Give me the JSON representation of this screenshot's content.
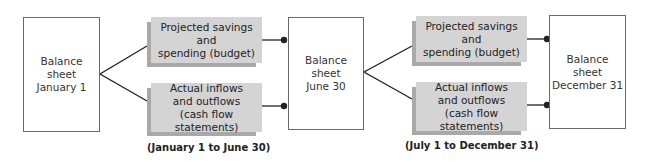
{
  "diagram": {
    "balance_sheets": [
      {
        "label": "Balance\nsheet\nJanuary 1"
      },
      {
        "label": "Balance\nsheet\nJune 30"
      },
      {
        "label": "Balance\nsheet\nDecember 31"
      }
    ],
    "periods": [
      {
        "budget_label": "Projected savings and\nspending (budget)",
        "cashflow_label": "Actual inflows\nand outflows\n(cash flow statements)",
        "period_label": "(January 1 to June 30)"
      },
      {
        "budget_label": "Projected savings and\nspending (budget)",
        "cashflow_label": "Actual inflows\nand outflows\n(cash flow statements)",
        "period_label": "(July 1 to December 31)"
      }
    ],
    "colors": {
      "box_face": "#d4d4d4",
      "box_shadow": "#a9a9a9",
      "line": "#222222",
      "sheet_border": "#6a6a6a"
    }
  }
}
